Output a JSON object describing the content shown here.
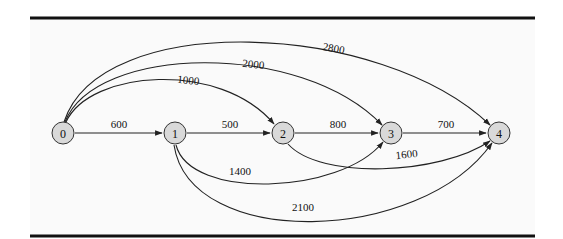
{
  "diagram": {
    "type": "directed-weighted-graph",
    "colors": {
      "node_fill": "#d9d9d9",
      "node_stroke": "#333333",
      "edge": "#222222",
      "rule": "#111111",
      "background": "#fafafa"
    },
    "nodes": [
      {
        "id": "0",
        "label": "0"
      },
      {
        "id": "1",
        "label": "1"
      },
      {
        "id": "2",
        "label": "2"
      },
      {
        "id": "3",
        "label": "3"
      },
      {
        "id": "4",
        "label": "4"
      }
    ],
    "edges": [
      {
        "from": "0",
        "to": "1",
        "weight": "600"
      },
      {
        "from": "1",
        "to": "2",
        "weight": "500"
      },
      {
        "from": "2",
        "to": "3",
        "weight": "800"
      },
      {
        "from": "3",
        "to": "4",
        "weight": "700"
      },
      {
        "from": "0",
        "to": "2",
        "weight": "1000"
      },
      {
        "from": "0",
        "to": "3",
        "weight": "2000"
      },
      {
        "from": "0",
        "to": "4",
        "weight": "2800"
      },
      {
        "from": "1",
        "to": "3",
        "weight": "1400"
      },
      {
        "from": "2",
        "to": "4",
        "weight": "1600"
      },
      {
        "from": "1",
        "to": "4",
        "weight": "2100"
      }
    ]
  }
}
